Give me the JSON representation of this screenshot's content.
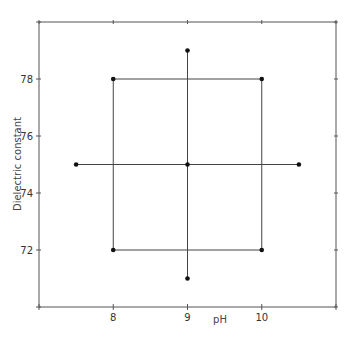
{
  "chart_data": {
    "type": "scatter",
    "title": "",
    "xlabel": "pH",
    "ylabel": "Dielectric constant",
    "xlim": [
      7,
      11
    ],
    "ylim": [
      70,
      80
    ],
    "xticks": [
      8,
      9,
      10
    ],
    "xticks_minor": [
      7,
      8,
      9,
      10,
      11
    ],
    "yticks": [
      72,
      74,
      76,
      78
    ],
    "grid": false,
    "legend": "none",
    "points": [
      {
        "x": 8,
        "y": 72
      },
      {
        "x": 8,
        "y": 78
      },
      {
        "x": 10,
        "y": 72
      },
      {
        "x": 10,
        "y": 78
      },
      {
        "x": 9,
        "y": 75
      },
      {
        "x": 7.5,
        "y": 75
      },
      {
        "x": 10.5,
        "y": 75
      },
      {
        "x": 9,
        "y": 71
      },
      {
        "x": 9,
        "y": 79
      }
    ],
    "lines": [
      {
        "name": "factorial-square",
        "x": [
          8,
          10,
          10,
          8,
          8
        ],
        "y": [
          78,
          78,
          72,
          72,
          78
        ]
      },
      {
        "name": "horizontal-axial",
        "x": [
          7.5,
          10.5
        ],
        "y": [
          75,
          75
        ]
      },
      {
        "name": "vertical-axial",
        "x": [
          9,
          9
        ],
        "y": [
          71,
          79
        ]
      }
    ]
  }
}
